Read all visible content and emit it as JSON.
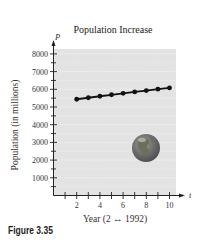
{
  "figure_caption": "Figure 3.35",
  "chart_data": {
    "type": "line",
    "title": "Population Increase",
    "xlabel": "Year (2 ↔ 1992)",
    "ylabel": "Population (in millions)",
    "x_axis_var": "t",
    "y_axis_var": "P",
    "x": [
      2,
      3,
      4,
      5,
      6,
      7,
      8,
      9,
      10
    ],
    "series": [
      {
        "name": "Population",
        "values": [
          5438,
          5522,
          5607,
          5691,
          5774,
          5849,
          5928,
          6006,
          6079
        ]
      }
    ],
    "x_ticks": [
      2,
      4,
      6,
      8,
      10
    ],
    "y_ticks": [
      1000,
      2000,
      3000,
      4000,
      5000,
      6000,
      7000,
      8000
    ],
    "xlim": [
      0,
      10.5
    ],
    "ylim": [
      0,
      8500
    ],
    "grid": true,
    "legend": "none",
    "annotations": [
      "earth-globe-image"
    ]
  }
}
